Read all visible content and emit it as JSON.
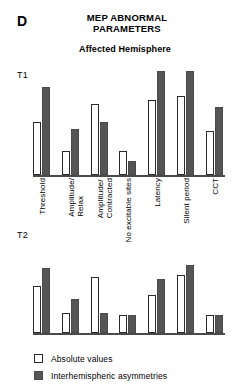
{
  "panel": {
    "letter": "D",
    "title": "MEP ABNORMAL PARAMETERS",
    "subtitle": "Affected Hemisphere"
  },
  "rows": [
    {
      "label": "T1"
    },
    {
      "label": "T2"
    }
  ],
  "legend": {
    "items": [
      {
        "label": "Absolute values",
        "swatch": "open",
        "color": "#ffffff"
      },
      {
        "label": "Interhemispheric asymmetries",
        "swatch": "solid",
        "color": "#555555"
      }
    ]
  },
  "chart_data": {
    "type": "bar",
    "title": "MEP ABNORMAL PARAMETERS",
    "subtitle": "Affected Hemisphere",
    "xlabel": "",
    "ylabel": "",
    "grid": false,
    "legend_position": "bottom-left",
    "categories": [
      "Threshold",
      "Amplitude/ Relax",
      "Amplitude/ Contracted",
      "No excitable sites",
      "Latency",
      "Silent period",
      "CCT"
    ],
    "category_lines": [
      [
        "Threshold"
      ],
      [
        "Amplitude/",
        "Relax"
      ],
      [
        "Amplitude/",
        "Contracted"
      ],
      [
        "No excitable sites"
      ],
      [
        "Latency"
      ],
      [
        "Silent period"
      ],
      [
        "CCT"
      ]
    ],
    "panels": [
      {
        "name": "T1",
        "ylim": [
          0,
          100
        ],
        "series": [
          {
            "name": "Absolute values",
            "style": "open",
            "values": [
              48,
              22,
              65,
              22,
              68,
              72,
              40
            ]
          },
          {
            "name": "Interhemispheric asymmetries",
            "style": "solid",
            "values": [
              80,
              42,
              48,
              13,
              95,
              95,
              62
            ]
          }
        ]
      },
      {
        "name": "T2",
        "ylim": [
          0,
          100
        ],
        "series": [
          {
            "name": "Absolute values",
            "style": "open",
            "values": [
              52,
              22,
              62,
              20,
              42,
              65,
              20
            ]
          },
          {
            "name": "Interhemispheric asymmetries",
            "style": "solid",
            "values": [
              72,
              38,
              22,
              20,
              60,
              76,
              20
            ]
          }
        ]
      }
    ]
  }
}
